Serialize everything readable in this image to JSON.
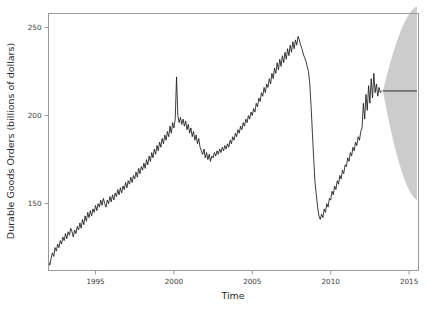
{
  "chart_data": {
    "type": "line",
    "title": "",
    "xlabel": "Time",
    "ylabel": "Durable Goods Orders (billions of dollars)",
    "xlim": [
      1992.0,
      2015.6
    ],
    "ylim": [
      112,
      258
    ],
    "xticks": [
      1995,
      2000,
      2005,
      2010,
      2015
    ],
    "xtick_labels": [
      "1995",
      "2000",
      "2005",
      "2010",
      "2015"
    ],
    "yticks": [
      150,
      200,
      250
    ],
    "ytick_labels": [
      "150",
      "200",
      "250"
    ],
    "grid": false,
    "legend": "none",
    "series": [
      {
        "name": "Durable Goods Orders (historical)",
        "color": "#1a1a1a",
        "x": [
          1992.0,
          1992.083,
          1992.167,
          1992.25,
          1992.333,
          1992.417,
          1992.5,
          1992.583,
          1992.667,
          1992.75,
          1992.833,
          1992.917,
          1993.0,
          1993.083,
          1993.167,
          1993.25,
          1993.333,
          1993.417,
          1993.5,
          1993.583,
          1993.667,
          1993.75,
          1993.833,
          1993.917,
          1994.0,
          1994.083,
          1994.167,
          1994.25,
          1994.333,
          1994.417,
          1994.5,
          1994.583,
          1994.667,
          1994.75,
          1994.833,
          1994.917,
          1995.0,
          1995.083,
          1995.167,
          1995.25,
          1995.333,
          1995.417,
          1995.5,
          1995.583,
          1995.667,
          1995.75,
          1995.833,
          1995.917,
          1996.0,
          1996.083,
          1996.167,
          1996.25,
          1996.333,
          1996.417,
          1996.5,
          1996.583,
          1996.667,
          1996.75,
          1996.833,
          1996.917,
          1997.0,
          1997.083,
          1997.167,
          1997.25,
          1997.333,
          1997.417,
          1997.5,
          1997.583,
          1997.667,
          1997.75,
          1997.833,
          1997.917,
          1998.0,
          1998.083,
          1998.167,
          1998.25,
          1998.333,
          1998.417,
          1998.5,
          1998.583,
          1998.667,
          1998.75,
          1998.833,
          1998.917,
          1999.0,
          1999.083,
          1999.167,
          1999.25,
          1999.333,
          1999.417,
          1999.5,
          1999.583,
          1999.667,
          1999.75,
          1999.833,
          1999.917,
          2000.0,
          2000.083,
          2000.167,
          2000.25,
          2000.333,
          2000.417,
          2000.5,
          2000.583,
          2000.667,
          2000.75,
          2000.833,
          2000.917,
          2001.0,
          2001.083,
          2001.167,
          2001.25,
          2001.333,
          2001.417,
          2001.5,
          2001.583,
          2001.667,
          2001.75,
          2001.833,
          2001.917,
          2002.0,
          2002.083,
          2002.167,
          2002.25,
          2002.333,
          2002.417,
          2002.5,
          2002.583,
          2002.667,
          2002.75,
          2002.833,
          2002.917,
          2003.0,
          2003.083,
          2003.167,
          2003.25,
          2003.333,
          2003.417,
          2003.5,
          2003.583,
          2003.667,
          2003.75,
          2003.833,
          2003.917,
          2004.0,
          2004.083,
          2004.167,
          2004.25,
          2004.333,
          2004.417,
          2004.5,
          2004.583,
          2004.667,
          2004.75,
          2004.833,
          2004.917,
          2005.0,
          2005.083,
          2005.167,
          2005.25,
          2005.333,
          2005.417,
          2005.5,
          2005.583,
          2005.667,
          2005.75,
          2005.833,
          2005.917,
          2006.0,
          2006.083,
          2006.167,
          2006.25,
          2006.333,
          2006.417,
          2006.5,
          2006.583,
          2006.667,
          2006.75,
          2006.833,
          2006.917,
          2007.0,
          2007.083,
          2007.167,
          2007.25,
          2007.333,
          2007.417,
          2007.5,
          2007.583,
          2007.667,
          2007.75,
          2007.833,
          2007.917,
          2008.0,
          2008.083,
          2008.167,
          2008.25,
          2008.333,
          2008.417,
          2008.5,
          2008.583,
          2008.667,
          2008.75,
          2008.833,
          2008.917,
          2009.0,
          2009.083,
          2009.167,
          2009.25,
          2009.333,
          2009.417,
          2009.5,
          2009.583,
          2009.667,
          2009.75,
          2009.833,
          2009.917,
          2010.0,
          2010.083,
          2010.167,
          2010.25,
          2010.333,
          2010.417,
          2010.5,
          2010.583,
          2010.667,
          2010.75,
          2010.833,
          2010.917,
          2011.0,
          2011.083,
          2011.167,
          2011.25,
          2011.333,
          2011.417,
          2011.5,
          2011.583,
          2011.667,
          2011.75,
          2011.833,
          2011.917,
          2012.0,
          2012.083,
          2012.167,
          2012.25,
          2012.333,
          2012.417,
          2012.5,
          2012.583,
          2012.667,
          2012.75,
          2012.833,
          2012.917,
          2013.0,
          2013.083,
          2013.167,
          2013.25
        ],
        "y": [
          117,
          115,
          119,
          122,
          120,
          125,
          123,
          127,
          125,
          129,
          127,
          131,
          129,
          133,
          130,
          134,
          132,
          136,
          134,
          131,
          135,
          133,
          137,
          135,
          139,
          136,
          141,
          138,
          143,
          140,
          145,
          142,
          146,
          143,
          147,
          145,
          149,
          146,
          150,
          148,
          152,
          149,
          153,
          150,
          148,
          152,
          150,
          154,
          151,
          155,
          152,
          156,
          154,
          158,
          155,
          159,
          156,
          160,
          158,
          162,
          159,
          163,
          161,
          165,
          162,
          166,
          164,
          168,
          165,
          170,
          167,
          171,
          169,
          173,
          170,
          175,
          172,
          177,
          174,
          179,
          176,
          181,
          178,
          183,
          180,
          185,
          182,
          187,
          184,
          189,
          186,
          191,
          188,
          194,
          190,
          196,
          193,
          198,
          222,
          200,
          196,
          199,
          195,
          198,
          194,
          197,
          192,
          195,
          190,
          193,
          188,
          191,
          186,
          189,
          184,
          187,
          182,
          180,
          178,
          181,
          176,
          179,
          175,
          178,
          174,
          177,
          176,
          179,
          177,
          180,
          178,
          181,
          179,
          182,
          180,
          183,
          181,
          184,
          182,
          186,
          184,
          188,
          186,
          190,
          188,
          192,
          190,
          194,
          192,
          196,
          194,
          198,
          196,
          200,
          198,
          202,
          200,
          204,
          202,
          207,
          205,
          210,
          208,
          213,
          211,
          216,
          213,
          218,
          216,
          221,
          218,
          224,
          221,
          227,
          224,
          230,
          226,
          232,
          228,
          234,
          230,
          236,
          232,
          238,
          234,
          240,
          236,
          242,
          238,
          243,
          240,
          245,
          243,
          240,
          238,
          235,
          233,
          231,
          228,
          225,
          218,
          205,
          190,
          175,
          162,
          155,
          148,
          143,
          141,
          144,
          142,
          147,
          145,
          150,
          148,
          153,
          152,
          157,
          155,
          160,
          158,
          163,
          161,
          166,
          164,
          169,
          167,
          172,
          171,
          176,
          174,
          179,
          177,
          182,
          180,
          185,
          183,
          188,
          186,
          191,
          193,
          207,
          198,
          212,
          203,
          217,
          207,
          221,
          210,
          224,
          213,
          218,
          211,
          216,
          213,
          214
        ]
      }
    ],
    "forecast": {
      "name": "Forecast (mean)",
      "color": "#1a1a1a",
      "start_x": 2013.33,
      "end_x": 2015.5,
      "mean_start": 214,
      "mean_end": 214,
      "band_color": "#cccccc",
      "band_upper_start": 214,
      "band_upper_end": 262,
      "band_lower_start": 214,
      "band_lower_end": 152
    }
  },
  "axes": {
    "y_title": "Durable Goods Orders (billions of dollars)",
    "x_title": "Time",
    "ytick_0": "150",
    "ytick_1": "200",
    "ytick_2": "250",
    "xtick_0": "1995",
    "xtick_1": "2000",
    "xtick_2": "2005",
    "xtick_3": "2010",
    "xtick_4": "2015"
  },
  "colors": {
    "line": "#1a1a1a",
    "band": "#cccccc",
    "frame": "#9a9a9a",
    "text": "#2b2b2b",
    "background": "#ffffff"
  }
}
